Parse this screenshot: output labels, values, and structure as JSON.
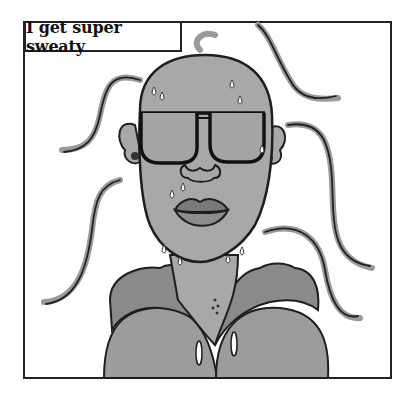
{
  "comic": {
    "caption": "I get super sweaty",
    "subject": "bald person with sunglasses, sweating",
    "colors": {
      "skin": "#a8a8a8",
      "hood": "#8e8e8e",
      "hoodie": "#9c9c9c",
      "hair_strand": "#9a9a9a",
      "outline": "#1e1e1e",
      "lips": "#7a7a7a",
      "background": "#ffffff"
    }
  }
}
